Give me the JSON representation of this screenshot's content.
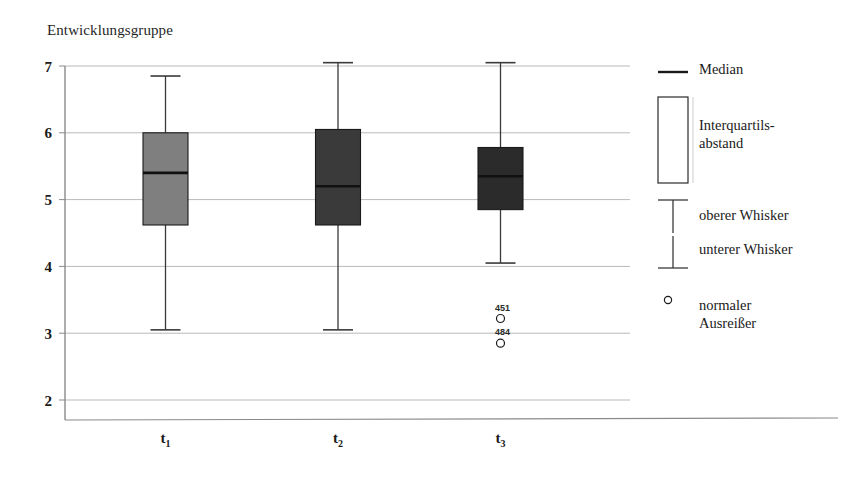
{
  "chart_data": {
    "type": "boxplot",
    "title": "Entwicklungsgruppe",
    "xlabel": "",
    "ylabel": "",
    "ylim": [
      2,
      7
    ],
    "yticks": [
      2,
      3,
      4,
      5,
      6,
      7
    ],
    "ytick_labels": [
      "2",
      "3",
      "4",
      "5",
      "6",
      "7"
    ],
    "grid": true,
    "categories": [
      "t1",
      "t2",
      "t3"
    ],
    "category_labels": [
      {
        "base": "t",
        "sub": "1"
      },
      {
        "base": "t",
        "sub": "2"
      },
      {
        "base": "t",
        "sub": "3"
      }
    ],
    "boxes": [
      {
        "name": "t1",
        "whisker_low": 3.05,
        "q1": 4.62,
        "median": 5.4,
        "q3": 6.0,
        "whisker_high": 6.85,
        "fill": "#7f7f7f",
        "outliers": []
      },
      {
        "name": "t2",
        "whisker_low": 3.05,
        "q1": 4.62,
        "median": 5.2,
        "q3": 6.05,
        "whisker_high": 7.05,
        "fill": "#3a3a3a",
        "outliers": []
      },
      {
        "name": "t3",
        "whisker_low": 4.05,
        "q1": 4.85,
        "median": 5.35,
        "q3": 5.78,
        "whisker_high": 7.05,
        "fill": "#2b2b2b",
        "outliers": [
          {
            "value": 3.22,
            "label": "451"
          },
          {
            "value": 2.85,
            "label": "484"
          }
        ]
      }
    ],
    "colors": {
      "grid": "#b9b9b9",
      "axis": "#8a8a8a",
      "box_edge": "#1a1a1a",
      "median_line": "#111111",
      "whisker": "#3a3a3a",
      "outlier_edge": "#1a1a1a",
      "background": "#ffffff"
    }
  },
  "legend": {
    "title": "",
    "items": [
      {
        "key": "median",
        "symbol": "median-line",
        "label": "Median"
      },
      {
        "key": "iqr",
        "symbol": "box-outline",
        "label": "Interquartils-\nabstand"
      },
      {
        "key": "upper_whisker",
        "symbol": "upper-whisker-tee",
        "label": "oberer Whisker"
      },
      {
        "key": "lower_whisker",
        "symbol": "lower-whisker-tee",
        "label": "unterer Whisker"
      },
      {
        "key": "outlier",
        "symbol": "open-circle",
        "label": "normaler\nAusreißer"
      }
    ]
  }
}
